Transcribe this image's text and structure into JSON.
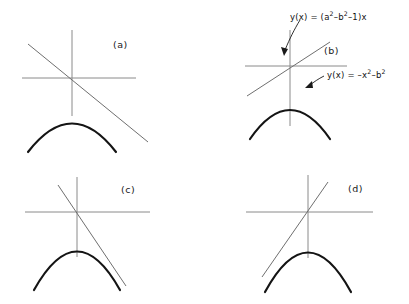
{
  "figure": {
    "width": 409,
    "height": 304,
    "background": "#ffffff",
    "curve_color": "#141414",
    "axis_color": "#8a8a8a",
    "tangent_color": "#6f6f6f",
    "text_color": "#111111"
  },
  "panels": [
    {
      "id": "a",
      "label": "(a)",
      "label_x": 113,
      "label_y": 39,
      "origin_x": 72,
      "origin_y": 78,
      "x_axis": {
        "x1": 22,
        "x2": 136,
        "y": 78
      },
      "y_axis": {
        "y1": 30,
        "y2": 116,
        "x": 72
      },
      "tangent": {
        "x1": 28,
        "y1": 44,
        "x2": 148,
        "y2": 142
      },
      "parabola": {
        "vertex_x": 72,
        "vertex_y": 101,
        "half_width": 42,
        "depth": 54
      },
      "tangent_slope_sign": "negative",
      "tangent_touch": "none"
    },
    {
      "id": "b",
      "label": "(b)",
      "label_x": 324,
      "label_y": 45,
      "origin_x": 290,
      "origin_y": 66,
      "x_axis": {
        "x1": 245,
        "x2": 347,
        "y": 66
      },
      "y_axis": {
        "y1": 30,
        "y2": 126,
        "x": 290
      },
      "tangent": {
        "x1": 247,
        "y1": 96,
        "x2": 330,
        "y2": 42
      },
      "parabola": {
        "vertex_x": 290,
        "vertex_y": 87,
        "half_width": 38,
        "depth": 52
      },
      "tangent_slope_sign": "positive",
      "tangent_touch": "none"
    },
    {
      "id": "c",
      "label": "(c)",
      "label_x": 121,
      "label_y": 184,
      "origin_x": 77,
      "origin_y": 212,
      "x_axis": {
        "x1": 25,
        "x2": 150,
        "y": 212
      },
      "y_axis": {
        "y1": 177,
        "y2": 257,
        "x": 77
      },
      "tangent": {
        "x1": 58,
        "y1": 185,
        "x2": 125,
        "y2": 284
      },
      "parabola": {
        "vertex_x": 77,
        "vertex_y": 221,
        "half_width": 43,
        "depth": 64
      },
      "tangent_slope_sign": "negative",
      "tangent_touch": "right"
    },
    {
      "id": "d",
      "label": "(d)",
      "label_x": 348,
      "label_y": 183,
      "origin_x": 308,
      "origin_y": 212,
      "x_axis": {
        "x1": 246,
        "x2": 373,
        "y": 212
      },
      "y_axis": {
        "y1": 175,
        "y2": 258,
        "x": 308
      },
      "tangent": {
        "x1": 262,
        "y1": 275,
        "x2": 327,
        "y2": 184
      },
      "parabola": {
        "vertex_x": 308,
        "vertex_y": 221,
        "half_width": 43,
        "depth": 64
      },
      "tangent_slope_sign": "positive",
      "tangent_touch": "left"
    }
  ],
  "annotations": {
    "line_equation": {
      "prefix": "y(x) = (a",
      "sup1": "2",
      "mid1": "–b",
      "sup2": "2",
      "suffix": "–1)x",
      "x": 290,
      "y": 14
    },
    "parabola_equation": {
      "prefix": "y(x) = –x",
      "sup1": "2",
      "mid1": "–b",
      "sup2": "2",
      "suffix": "",
      "x": 327,
      "y": 72
    }
  }
}
